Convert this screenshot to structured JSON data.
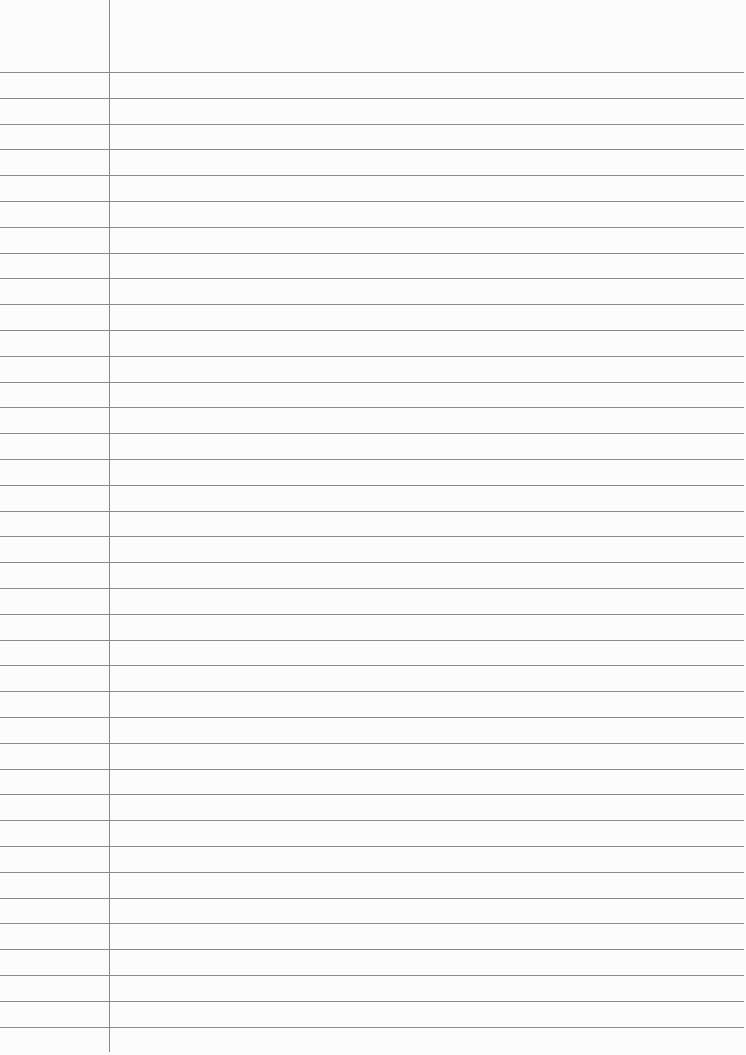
{
  "paper": {
    "type": "lined-paper",
    "line_color": "#8a8a8a",
    "background": "#fcfcfc",
    "first_line_y": 72,
    "line_spacing": 25.8,
    "line_count": 38,
    "margin_x": 109
  }
}
